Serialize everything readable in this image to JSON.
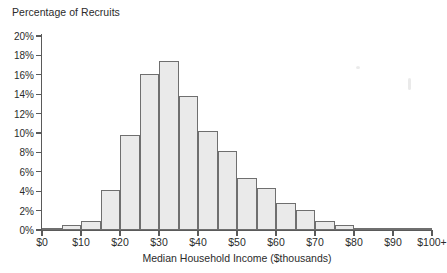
{
  "chart_data": {
    "type": "bar",
    "title": "",
    "ylabel": "Percentage of Recruits",
    "xlabel": "Median Household Income ($thousands)",
    "categories": [
      "$0-5",
      "$5-10",
      "$10-15",
      "$15-20",
      "$20-25",
      "$25-30",
      "$30-35",
      "$35-40",
      "$40-45",
      "$45-50",
      "$50-55",
      "$55-60",
      "$60-65",
      "$65-70",
      "$70-75",
      "$75-80",
      "$80-85",
      "$85-90",
      "$90-95",
      "$95-100+"
    ],
    "values": [
      0.1,
      0.5,
      0.95,
      4.15,
      9.8,
      16.1,
      17.45,
      13.8,
      10.2,
      8.15,
      5.4,
      4.35,
      2.8,
      2.1,
      0.95,
      0.55,
      0.25,
      0.15,
      0.05,
      0.2
    ],
    "ylim": [
      0,
      20
    ],
    "ytick_labels": [
      "0%",
      "2%",
      "4%",
      "6%",
      "8%",
      "10%",
      "12%",
      "14%",
      "16%",
      "18%",
      "20%"
    ],
    "ytick_values": [
      0,
      2,
      4,
      6,
      8,
      10,
      12,
      14,
      16,
      18,
      20
    ],
    "xtick_labels": [
      "$0",
      "$10",
      "$20",
      "$30",
      "$40",
      "$50",
      "$60",
      "$70",
      "$80",
      "$90",
      "$100+"
    ],
    "xtick_values": [
      0,
      10,
      20,
      30,
      40,
      50,
      60,
      70,
      80,
      90,
      100
    ],
    "xlim": [
      0,
      100
    ],
    "grid": false,
    "legend": null,
    "bar_fill_color": "#eaeaea",
    "bar_border_color": "#6f6f6f",
    "axis_color": "#5a5a5a",
    "text_color": "#2b2b2b"
  }
}
